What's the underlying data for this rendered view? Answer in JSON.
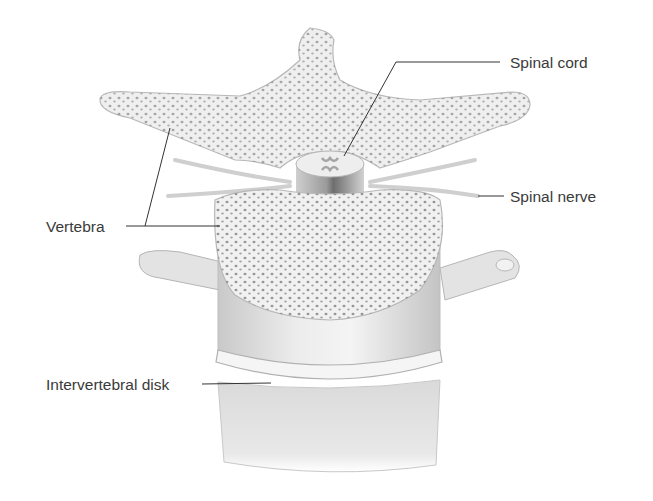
{
  "diagram": {
    "labels": {
      "spinal_cord": "Spinal cord",
      "spinal_nerve": "Spinal nerve",
      "vertebra": "Vertebra",
      "intervertebral_disk": "Intervertebral disk"
    }
  },
  "colors": {
    "background": "#ffffff",
    "bone_fill": "#efefef",
    "bone_outline": "#b8b8b8",
    "pore_dots": "#8a8a8a",
    "leader_lines": "#333333",
    "label_text": "#3a3a3a"
  }
}
